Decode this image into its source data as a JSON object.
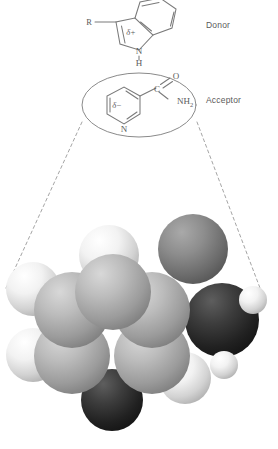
{
  "figure": {
    "background_color": "#ffffff",
    "line_color": "#7a7a7a",
    "text_color": "#5a5a5a"
  },
  "labels": {
    "donor": "Donor",
    "acceptor": "Acceptor"
  },
  "donor_structure": {
    "name": "indole",
    "substituent": "R",
    "partial_charge": "δ+",
    "ring_nitrogen": "N",
    "ring_nh_hydrogen": "H"
  },
  "acceptor_structure": {
    "name": "nicotinamide",
    "partial_charge": "δ−",
    "ring_nitrogen": "N",
    "carbonyl_carbon": "C",
    "carbonyl_oxygen": "O",
    "amide_group": "NH",
    "amide_subscript": "2",
    "enclosure_shape": "ellipse"
  },
  "model": {
    "type": "space-filling-cpk",
    "atom_colors": {
      "hydrogen": "#e8e8e8",
      "carbon": "#a8a8a8",
      "nitrogen": "#2b2b2b",
      "oxygen": "#6e6e6e"
    },
    "atoms": [
      {
        "element": "H",
        "cx": 33,
        "cy": 289,
        "r": 27
      },
      {
        "element": "H",
        "cx": 33,
        "cy": 355,
        "r": 27
      },
      {
        "element": "H",
        "cx": 109,
        "cy": 255,
        "r": 30
      },
      {
        "element": "O",
        "cx": 193,
        "cy": 249,
        "r": 35
      },
      {
        "element": "C",
        "cx": 72,
        "cy": 310,
        "r": 38
      },
      {
        "element": "C",
        "cx": 113,
        "cy": 292,
        "r": 38
      },
      {
        "element": "C",
        "cx": 152,
        "cy": 310,
        "r": 38
      },
      {
        "element": "C",
        "cx": 72,
        "cy": 356,
        "r": 38
      },
      {
        "element": "C",
        "cx": 152,
        "cy": 356,
        "r": 38
      },
      {
        "element": "N",
        "cx": 112,
        "cy": 400,
        "r": 31
      },
      {
        "element": "N",
        "cx": 222,
        "cy": 320,
        "r": 37
      },
      {
        "element": "H",
        "cx": 253,
        "cy": 300,
        "r": 14
      },
      {
        "element": "H",
        "cx": 224,
        "cy": 365,
        "r": 14
      },
      {
        "element": "H",
        "cx": 185,
        "cy": 378,
        "r": 26
      }
    ]
  },
  "projection_lines": {
    "description": "dashed guide lines from acceptor ellipse to space-filling model",
    "left": {
      "x1": 82,
      "y1": 122,
      "x2": 6,
      "y2": 288
    },
    "right": {
      "x1": 197,
      "y1": 122,
      "x2": 260,
      "y2": 288
    }
  }
}
